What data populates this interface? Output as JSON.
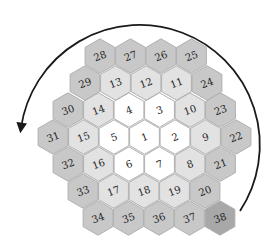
{
  "diagram": {
    "type": "hexagonal-grid",
    "colors": {
      "ring0": "#ffffff",
      "ring1": "#e2e2e2",
      "ring2": "#c8c8c8",
      "highlight": "#a8a8a8",
      "stroke": "#b0b0b0",
      "arrow": "#1a1a1a",
      "text": "#222222"
    },
    "arrow": {
      "direction": "counter-clockwise",
      "start": "bottom-right",
      "end": "left"
    },
    "rows": [
      {
        "y": 56,
        "x0": 100,
        "cells": [
          {
            "n": "28",
            "ring": 2
          },
          {
            "n": "27",
            "ring": 2
          },
          {
            "n": "26",
            "ring": 2
          },
          {
            "n": "25",
            "ring": 2
          }
        ]
      },
      {
        "y": 83,
        "x0": 85,
        "cells": [
          {
            "n": "29",
            "ring": 2
          },
          {
            "n": "13",
            "ring": 1
          },
          {
            "n": "12",
            "ring": 1
          },
          {
            "n": "11",
            "ring": 1
          },
          {
            "n": "24",
            "ring": 2
          }
        ]
      },
      {
        "y": 110,
        "x0": 68,
        "cells": [
          {
            "n": "30",
            "ring": 2
          },
          {
            "n": "14",
            "ring": 1
          },
          {
            "n": "4",
            "ring": 0
          },
          {
            "n": "3",
            "ring": 0
          },
          {
            "n": "10",
            "ring": 1
          },
          {
            "n": "23",
            "ring": 2
          }
        ]
      },
      {
        "y": 137,
        "x0": 53,
        "cells": [
          {
            "n": "31",
            "ring": 2
          },
          {
            "n": "15",
            "ring": 1
          },
          {
            "n": "5",
            "ring": 0
          },
          {
            "n": "1",
            "ring": 0
          },
          {
            "n": "2",
            "ring": 0
          },
          {
            "n": "9",
            "ring": 1
          },
          {
            "n": "22",
            "ring": 2
          }
        ]
      },
      {
        "y": 164,
        "x0": 68,
        "cells": [
          {
            "n": "32",
            "ring": 2
          },
          {
            "n": "16",
            "ring": 1
          },
          {
            "n": "6",
            "ring": 0
          },
          {
            "n": "7",
            "ring": 0
          },
          {
            "n": "8",
            "ring": 1
          },
          {
            "n": "21",
            "ring": 2
          }
        ]
      },
      {
        "y": 191,
        "x0": 83,
        "cells": [
          {
            "n": "33",
            "ring": 2
          },
          {
            "n": "17",
            "ring": 1
          },
          {
            "n": "18",
            "ring": 1
          },
          {
            "n": "19",
            "ring": 1
          },
          {
            "n": "20",
            "ring": 2
          }
        ]
      },
      {
        "y": 218,
        "x0": 98,
        "cells": [
          {
            "n": "34",
            "ring": 2
          },
          {
            "n": "35",
            "ring": 2
          },
          {
            "n": "36",
            "ring": 2
          },
          {
            "n": "37",
            "ring": 2
          },
          {
            "n": "38",
            "ring": 3
          }
        ]
      }
    ]
  }
}
